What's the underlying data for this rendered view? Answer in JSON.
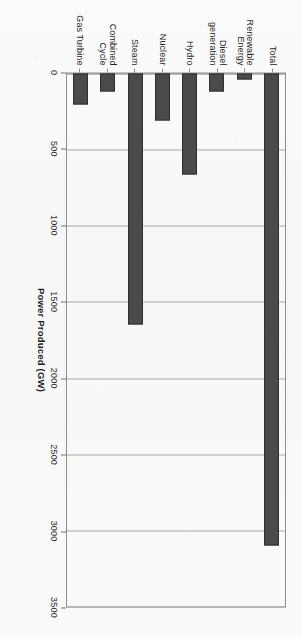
{
  "chart_data": {
    "type": "bar",
    "orientation": "horizontal",
    "title": "",
    "xlabel": "",
    "ylabel": "Power Produced (GW)",
    "categories": [
      "Gas Turbine",
      "Combined Cycle",
      "Steam",
      "Nuclear",
      "Hydro",
      "Diesel generation",
      "Renewable\nEnergy",
      "Total"
    ],
    "values": [
      205,
      120,
      1650,
      310,
      660,
      120,
      40,
      3100
    ],
    "ylim": [
      0,
      3500
    ],
    "yticks": [
      0,
      500,
      1000,
      1500,
      2000,
      2500,
      3000,
      3500
    ],
    "ytick_labels": [
      "0",
      "500",
      "1000",
      "1500",
      "2000",
      "2500",
      "3000",
      "3500"
    ],
    "grid": true,
    "legend": false,
    "bar_color": "#4a4a4a",
    "bar_edge_color": "#2f2f2f",
    "grid_color": "#a6a6a6",
    "axis_color": "#8e8e8e",
    "page_rotation_degrees": 90
  },
  "figure": {
    "axis_title": "Power Produced (GW)"
  }
}
